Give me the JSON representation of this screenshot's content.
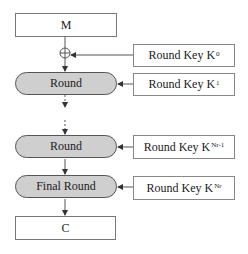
{
  "diagram": {
    "input": {
      "label": "M"
    },
    "output": {
      "label": "C"
    },
    "xor": {
      "symbol": "xor-circle"
    },
    "rounds": [
      {
        "label": "Round"
      },
      {
        "label": "Round"
      },
      {
        "label": "Final Round"
      }
    ],
    "keys": [
      {
        "label": "Round Key K",
        "sup": "0"
      },
      {
        "label": "Round Key K",
        "sup": "1"
      },
      {
        "label": "Round Key K",
        "sup": "Nr-1"
      },
      {
        "label": "Round Key K",
        "sup": "Nr"
      }
    ],
    "colors": {
      "round_fill": "#cfcfcf",
      "stroke": "#555555"
    }
  }
}
